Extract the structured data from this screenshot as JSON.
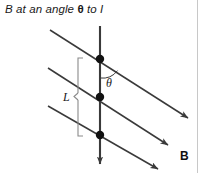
{
  "figure": {
    "caption": {
      "prefix": "B at an angle ",
      "symbol": "θ",
      "suffix": " to I"
    },
    "background_color": "#ffffff",
    "line_color": "#3a3a3a",
    "dot_color": "#111111",
    "labels": {
      "angle": "θ",
      "length": "L",
      "field": "B"
    },
    "elements": {
      "current_wire_name": "current-wire-I",
      "field_line_name": "magnetic-field-line",
      "charge_dot_name": "charge-dot",
      "angle_arc_name": "angle-arc",
      "length_brace_name": "length-brace"
    },
    "geometry": {
      "wire_x": 100,
      "wire_top_y": 26,
      "wire_bottom_y": 170,
      "dots_y": [
        59,
        97,
        135
      ],
      "dot_radius": 4.2,
      "field_line_slope": 0.47,
      "field_line_starts": [
        [
          50,
          30
        ],
        [
          48,
          68
        ],
        [
          48,
          106
        ]
      ],
      "field_line_ends": [
        [
          192,
          120
        ],
        [
          172,
          148
        ],
        [
          162,
          170
        ]
      ],
      "brace_x": 78,
      "brace_top_y": 58,
      "brace_bottom_y": 136,
      "angle_label_pos": [
        106,
        86
      ],
      "length_label_pos": [
        64,
        101
      ],
      "field_label_pos": [
        180,
        160
      ]
    }
  }
}
